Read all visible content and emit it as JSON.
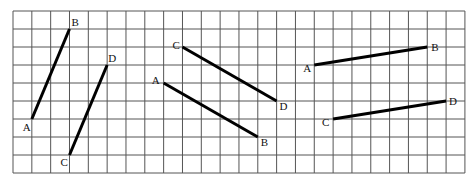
{
  "grid": {
    "origin_x": 13,
    "origin_y": 11,
    "cols": 24,
    "rows": 9,
    "cell_w": 18.83,
    "cell_h": 18,
    "line_color": "#555555",
    "segment_color": "#000000"
  },
  "figures": [
    {
      "name": "figure-1",
      "segments": [
        {
          "from": {
            "label": "A",
            "col": 1,
            "row": 6,
            "dx": -9,
            "dy": 12
          },
          "to": {
            "label": "B",
            "col": 3,
            "row": 1,
            "dx": 2,
            "dy": -3
          }
        },
        {
          "from": {
            "label": "C",
            "col": 3,
            "row": 8,
            "dx": -9,
            "dy": 11
          },
          "to": {
            "label": "D",
            "col": 5,
            "row": 3,
            "dx": 1,
            "dy": -3
          }
        }
      ]
    },
    {
      "name": "figure-2",
      "segments": [
        {
          "from": {
            "label": "C",
            "col": 9,
            "row": 2,
            "dx": -10,
            "dy": 2
          },
          "to": {
            "label": "D",
            "col": 14,
            "row": 5,
            "dx": 3,
            "dy": 9
          }
        },
        {
          "from": {
            "label": "A",
            "col": 8,
            "row": 4,
            "dx": -12,
            "dy": 1
          },
          "to": {
            "label": "B",
            "col": 13,
            "row": 7,
            "dx": 3,
            "dy": 9
          }
        }
      ]
    },
    {
      "name": "figure-3",
      "segments": [
        {
          "from": {
            "label": "A",
            "col": 16,
            "row": 3,
            "dx": -11,
            "dy": 7
          },
          "to": {
            "label": "B",
            "col": 22,
            "row": 2,
            "dx": 4,
            "dy": 4
          }
        },
        {
          "from": {
            "label": "C",
            "col": 17,
            "row": 6,
            "dx": -11,
            "dy": 7
          },
          "to": {
            "label": "D",
            "col": 23,
            "row": 5,
            "dx": 3,
            "dy": 4
          }
        }
      ]
    }
  ]
}
